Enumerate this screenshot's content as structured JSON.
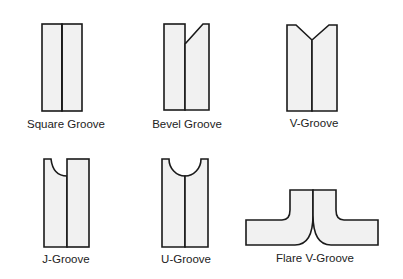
{
  "diagram": {
    "colors": {
      "fill": "#f1f1f1",
      "stroke": "#1a1a1a",
      "text": "#222222",
      "background": "#ffffff"
    },
    "grooves": [
      {
        "id": "square",
        "label": "Square Groove",
        "label_x": 66,
        "label_y": 119
      },
      {
        "id": "bevel",
        "label": "Bevel Groove",
        "label_x": 187,
        "label_y": 119
      },
      {
        "id": "v",
        "label": "V-Groove",
        "label_x": 314,
        "label_y": 118
      },
      {
        "id": "j",
        "label": "J-Groove",
        "label_x": 66,
        "label_y": 254
      },
      {
        "id": "u",
        "label": "U-Groove",
        "label_x": 186,
        "label_y": 254
      },
      {
        "id": "flare-v",
        "label": "Flare V-Groove",
        "label_x": 315,
        "label_y": 253
      }
    ]
  }
}
